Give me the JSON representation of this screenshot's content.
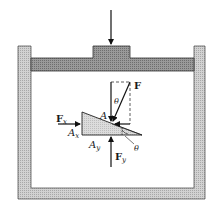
{
  "diagram": {
    "labels": {
      "force": "F",
      "theta_top": "θ",
      "point_a": "A",
      "fx": "F",
      "fx_sub": "x",
      "ax": "A",
      "ax_sub": "x",
      "ay": "A",
      "ay_sub": "y",
      "fy": "F",
      "fy_sub": "y",
      "theta_bottom": "θ"
    },
    "colors": {
      "wall_fill": "#c8c8c8",
      "piston_fill": "#8c8c8c",
      "wedge_fill": "#cfcfcf",
      "stroke": "#222222"
    }
  }
}
